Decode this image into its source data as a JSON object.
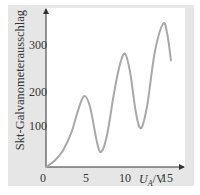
{
  "chart_data": {
    "type": "line",
    "title": "",
    "xlabel": "U_A/V",
    "xlabel_main": "U",
    "xlabel_sub": "A",
    "xlabel_unit": "/V",
    "ylabel": "Skt-Galvanometerausschlag",
    "xlim": [
      0,
      16
    ],
    "ylim": [
      0,
      370
    ],
    "x_ticks": [
      "0",
      "5",
      "10",
      "15"
    ],
    "y_ticks": [
      "100",
      "200",
      "300"
    ],
    "grid": false,
    "legend": null,
    "series": [
      {
        "name": "Galvanometerausschlag",
        "color": "#a8a8a8",
        "x": [
          0,
          1,
          2,
          3,
          3.8,
          4.5,
          5.2,
          6.0,
          6.5,
          7.2,
          8.0,
          8.7,
          9.3,
          9.9,
          10.6,
          11.2,
          11.9,
          12.8,
          13.8,
          14.3,
          14.7
        ],
        "y": [
          0,
          15,
          40,
          85,
          140,
          173,
          145,
          60,
          37,
          80,
          180,
          250,
          276,
          230,
          130,
          95,
          150,
          280,
          350,
          320,
          260
        ]
      }
    ]
  },
  "labels": {
    "ylabel": "Skt-Galvanometerausschlag",
    "x_tick_0": "0",
    "x_tick_5": "5",
    "x_tick_10": "10",
    "x_tick_15": "15",
    "y_tick_100": "100",
    "y_tick_200": "200",
    "y_tick_300": "300",
    "xlabel_main": "U",
    "xlabel_sub": "A",
    "xlabel_unit": "/V"
  },
  "colors": {
    "frame": "#e6e6e6",
    "plot": "#ffffff",
    "curve": "#a8a8a8",
    "axis": "#333333"
  }
}
